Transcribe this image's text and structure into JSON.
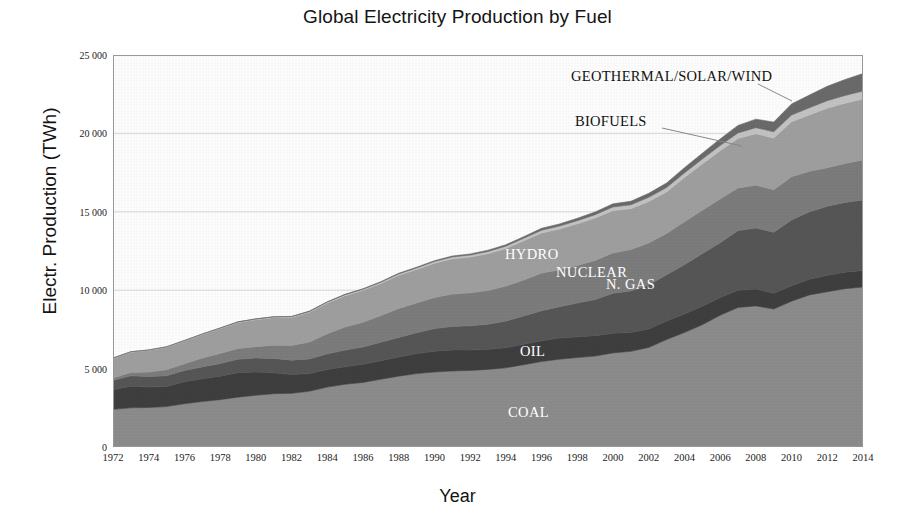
{
  "chart_data": {
    "type": "area",
    "stacked": true,
    "title": "Global Electricity Production by Fuel",
    "xlabel": "Year",
    "ylabel": "Electr. Production (TWh)",
    "grid": true,
    "legend_position": "inline-annotations",
    "xlim": [
      1972,
      2014
    ],
    "ylim": [
      0,
      25000
    ],
    "ytick_labels": [
      "0",
      "5 000",
      "10 000",
      "15 000",
      "20 000",
      "25 000"
    ],
    "ytick_values": [
      0,
      5000,
      10000,
      15000,
      20000,
      25000
    ],
    "xtick_labels": [
      "1972",
      "1974",
      "1976",
      "1978",
      "1980",
      "1982",
      "1984",
      "1986",
      "1988",
      "1990",
      "1992",
      "1994",
      "1996",
      "1998",
      "2000",
      "2002",
      "2004",
      "2006",
      "2008",
      "2010",
      "2012",
      "2014"
    ],
    "x": [
      1972,
      1973,
      1974,
      1975,
      1976,
      1977,
      1978,
      1979,
      1980,
      1981,
      1982,
      1983,
      1984,
      1985,
      1986,
      1987,
      1988,
      1989,
      1990,
      1991,
      1992,
      1993,
      1994,
      1995,
      1996,
      1997,
      1998,
      1999,
      2000,
      2001,
      2002,
      2003,
      2004,
      2005,
      2006,
      2007,
      2008,
      2009,
      2010,
      2011,
      2012,
      2013,
      2014
    ],
    "series": [
      {
        "name": "COAL",
        "color": "#8d8d8d",
        "label_color": "#ffffff",
        "values": [
          2400,
          2500,
          2520,
          2580,
          2760,
          2900,
          3020,
          3180,
          3300,
          3400,
          3420,
          3560,
          3820,
          4000,
          4120,
          4320,
          4520,
          4680,
          4780,
          4850,
          4880,
          4950,
          5050,
          5250,
          5450,
          5600,
          5700,
          5800,
          6000,
          6100,
          6350,
          6850,
          7300,
          7800,
          8400,
          8900,
          9000,
          8800,
          9300,
          9700,
          9900,
          10100,
          10200
        ]
      },
      {
        "name": "OIL",
        "color": "#3f3f3f",
        "label_color": "#ffffff",
        "values": [
          1250,
          1380,
          1300,
          1280,
          1400,
          1450,
          1500,
          1560,
          1480,
          1330,
          1200,
          1120,
          1120,
          1120,
          1160,
          1180,
          1220,
          1280,
          1330,
          1340,
          1300,
          1280,
          1280,
          1300,
          1320,
          1350,
          1330,
          1300,
          1250,
          1200,
          1180,
          1180,
          1180,
          1180,
          1130,
          1100,
          1070,
          1000,
          980,
          1000,
          1050,
          1050,
          1050
        ]
      },
      {
        "name": "N. GAS",
        "color": "#575757",
        "label_color": "#ffffff",
        "values": [
          600,
          660,
          670,
          690,
          720,
          760,
          800,
          860,
          900,
          920,
          920,
          940,
          1000,
          1060,
          1100,
          1180,
          1250,
          1330,
          1440,
          1500,
          1550,
          1600,
          1700,
          1800,
          1920,
          2000,
          2150,
          2300,
          2550,
          2650,
          2800,
          2950,
          3150,
          3350,
          3500,
          3800,
          3900,
          3900,
          4200,
          4300,
          4400,
          4450,
          4500
        ]
      },
      {
        "name": "NUCLEAR",
        "color": "#7d7d7d",
        "label_color": "#ffffff",
        "values": [
          150,
          210,
          290,
          380,
          430,
          560,
          650,
          680,
          720,
          840,
          930,
          1070,
          1280,
          1480,
          1570,
          1700,
          1840,
          1900,
          1980,
          2060,
          2100,
          2150,
          2230,
          2300,
          2400,
          2350,
          2400,
          2500,
          2580,
          2640,
          2680,
          2640,
          2740,
          2770,
          2790,
          2720,
          2730,
          2700,
          2760,
          2580,
          2460,
          2480,
          2550
        ]
      },
      {
        "name": "HYDRO",
        "color": "#a0a0a0",
        "label_color": "#ffffff",
        "values": [
          1250,
          1300,
          1380,
          1430,
          1450,
          1500,
          1580,
          1660,
          1720,
          1760,
          1790,
          1900,
          1960,
          1990,
          2040,
          2050,
          2120,
          2130,
          2190,
          2250,
          2280,
          2350,
          2400,
          2500,
          2560,
          2600,
          2650,
          2700,
          2700,
          2610,
          2650,
          2650,
          2820,
          2950,
          3070,
          3150,
          3280,
          3300,
          3500,
          3600,
          3800,
          3850,
          3900
        ]
      },
      {
        "name": "BIOFUELS",
        "color": "#c4c4c4",
        "label_color": "#111111",
        "values": [
          20,
          22,
          24,
          26,
          28,
          30,
          33,
          36,
          40,
          45,
          50,
          55,
          60,
          66,
          72,
          80,
          90,
          100,
          110,
          120,
          130,
          140,
          150,
          160,
          175,
          190,
          200,
          215,
          230,
          245,
          260,
          275,
          290,
          310,
          335,
          360,
          385,
          400,
          430,
          455,
          475,
          490,
          500
        ]
      },
      {
        "name": "GEOTHERMAL/SOLAR/WIND",
        "color": "#6b6b6b",
        "label_color": "#111111",
        "values": [
          6,
          7,
          8,
          9,
          10,
          11,
          12,
          14,
          15,
          17,
          19,
          21,
          24,
          28,
          32,
          36,
          41,
          47,
          54,
          62,
          71,
          81,
          92,
          105,
          120,
          136,
          155,
          176,
          200,
          228,
          258,
          292,
          330,
          374,
          424,
          480,
          545,
          620,
          710,
          810,
          920,
          1020,
          1120
        ]
      }
    ],
    "annotations": [
      {
        "text": "GEOTHERMAL/SOLAR/WIND",
        "placement": "outside",
        "leader": true
      },
      {
        "text": "BIOFUELS",
        "placement": "outside",
        "leader": true
      },
      {
        "text": "HYDRO",
        "placement": "inside",
        "leader": false
      },
      {
        "text": "NUCLEAR",
        "placement": "inside",
        "leader": false
      },
      {
        "text": "N. GAS",
        "placement": "inside",
        "leader": false
      },
      {
        "text": "OIL",
        "placement": "inside",
        "leader": false
      },
      {
        "text": "COAL",
        "placement": "inside",
        "leader": false
      }
    ]
  },
  "colors": {
    "background": "#ffffff",
    "axis": "#9a9a9a",
    "grid": "#d8d8d8",
    "text": "#141414"
  }
}
